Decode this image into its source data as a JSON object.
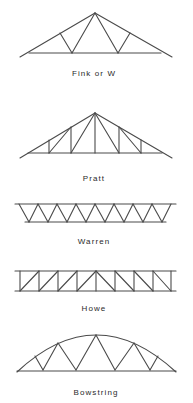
{
  "figure": {
    "stroke_color": "#4a4a4a",
    "text_color": "#2a2a2a",
    "background": "#ffffff"
  },
  "trusses": [
    {
      "id": "fink",
      "label": "Fink or W",
      "label_pos": [
        94,
        76
      ],
      "lines": [
        [
          20,
          57,
          95,
          13
        ],
        [
          95,
          13,
          172,
          57
        ],
        [
          29,
          53,
          161,
          53
        ],
        [
          95,
          13,
          72,
          53
        ],
        [
          60,
          33,
          72,
          53
        ],
        [
          95,
          13,
          118,
          53
        ],
        [
          130,
          33,
          118,
          53
        ]
      ]
    },
    {
      "id": "pratt",
      "label": "Pratt",
      "label_pos": [
        94,
        181
      ],
      "lines": [
        [
          20,
          158,
          95,
          113
        ],
        [
          95,
          113,
          172,
          158
        ],
        [
          28,
          153,
          162,
          153
        ],
        [
          49,
          140,
          49,
          153
        ],
        [
          71,
          127,
          71,
          153
        ],
        [
          95,
          113,
          95,
          153
        ],
        [
          119,
          127,
          119,
          153
        ],
        [
          141,
          140,
          141,
          153
        ],
        [
          49,
          153,
          71,
          127
        ],
        [
          71,
          153,
          95,
          113
        ],
        [
          119,
          153,
          95,
          113
        ],
        [
          141,
          153,
          119,
          127
        ]
      ]
    },
    {
      "id": "warren",
      "label": "Warren",
      "label_pos": [
        94,
        244
      ],
      "top_chord": [
        15,
        204,
        176,
        204
      ],
      "bottom_chord": [
        25,
        222,
        166,
        222
      ],
      "top_x": [
        19,
        38,
        57,
        76,
        95,
        114,
        133,
        152,
        171
      ],
      "bottom_x": [
        29,
        48,
        67,
        86,
        105,
        124,
        143,
        162
      ],
      "top_y": 204,
      "bottom_y": 222
    },
    {
      "id": "howe",
      "label": "Howe",
      "label_pos": [
        94,
        311
      ],
      "top_chord": [
        15,
        271,
        176,
        271
      ],
      "bottom_chord": [
        15,
        291,
        176,
        291
      ],
      "verticals_x": [
        20,
        39,
        58,
        77,
        96,
        115,
        134,
        153,
        171
      ],
      "top_y": 271,
      "bottom_y": 291
    },
    {
      "id": "bowstring",
      "label": "Bowstring",
      "label_pos": [
        96,
        395
      ],
      "arc": [
        17,
        372,
        96,
        335,
        176,
        372
      ],
      "bottom_chord": [
        17,
        371,
        176,
        371
      ],
      "web_points": [
        [
          35,
          356
        ],
        [
          43,
          370
        ],
        [
          58,
          343
        ],
        [
          76,
          370
        ],
        [
          96,
          335
        ],
        [
          115,
          370
        ],
        [
          134,
          343
        ],
        [
          150,
          370
        ],
        [
          158,
          356
        ]
      ]
    }
  ]
}
